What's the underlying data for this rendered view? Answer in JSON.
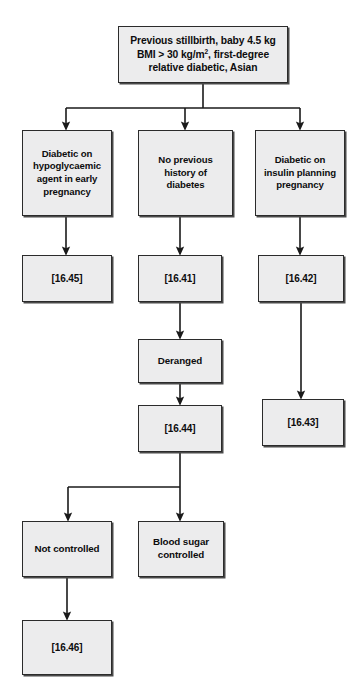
{
  "diagram": {
    "colors": {
      "node_fill": "#ececed",
      "node_border": "#2b2b2b",
      "connector": "#1a1a1a",
      "background": "#ffffff"
    },
    "nodes": {
      "root": {
        "line1": "Previous stillbirth, baby  4.5 kg",
        "line2_pre": "BMI > 30 kg/m",
        "line2_sup": "2",
        "line2_post": ", first-degree",
        "line3": "relative diabetic, Asian"
      },
      "branch_left": {
        "line1": "Diabetic on",
        "line2": "hypoglycaemic",
        "line3": "agent in early",
        "line4": "pregnancy"
      },
      "branch_mid": {
        "line1": "No previous",
        "line2": "history of",
        "line3": "diabetes"
      },
      "branch_right": {
        "line1": "Diabetic on",
        "line2": "insulin planning",
        "line3": "pregnancy"
      },
      "ref_16_45": {
        "label": "[16.45]"
      },
      "ref_16_41": {
        "label": "[16.41]"
      },
      "ref_16_42": {
        "label": "[16.42]"
      },
      "deranged": {
        "label": "Deranged"
      },
      "ref_16_44": {
        "label": "[16.44]"
      },
      "ref_16_43": {
        "label": "[16.43]"
      },
      "not_controlled": {
        "label": "Not controlled"
      },
      "blood_sugar_controlled": {
        "line1": "Blood sugar",
        "line2": "controlled"
      },
      "ref_16_46": {
        "label": "[16.46]"
      }
    }
  }
}
